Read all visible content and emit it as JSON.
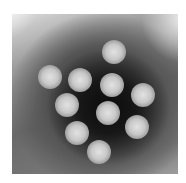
{
  "image": {
    "description": "Grayscale negative-stain electron micrograph showing a cluster of ten round virus particles on a dark background",
    "particle_count": 10,
    "particles": [
      {
        "x": 114,
        "y": 52
      },
      {
        "x": 50,
        "y": 77
      },
      {
        "x": 80,
        "y": 80
      },
      {
        "x": 112,
        "y": 85
      },
      {
        "x": 143,
        "y": 95
      },
      {
        "x": 67,
        "y": 105
      },
      {
        "x": 108,
        "y": 113
      },
      {
        "x": 137,
        "y": 127
      },
      {
        "x": 77,
        "y": 133
      },
      {
        "x": 99,
        "y": 152
      }
    ],
    "colors": {
      "background": "#ffffff",
      "stain_dark": "#141414",
      "particle_light": "#dcdcdc"
    }
  }
}
